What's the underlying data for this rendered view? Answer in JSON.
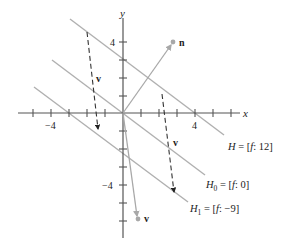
{
  "axes": {
    "x_label": "x",
    "y_label": "y",
    "x_tick_labels": [
      {
        "value": -4,
        "text": "−4"
      },
      {
        "value": 4,
        "text": "4"
      }
    ],
    "y_tick_labels": [
      {
        "value": 4,
        "text": "4"
      },
      {
        "value": -4,
        "text": "−4"
      }
    ],
    "x_range": [
      -6,
      6.5
    ],
    "y_range": [
      -7,
      5.4
    ],
    "tick_step": 1
  },
  "vectors": {
    "n": {
      "label": "n",
      "components": [
        3,
        4
      ]
    },
    "v": {
      "label": "v",
      "components": [
        0.8,
        -5.9
      ]
    }
  },
  "hyperplanes": [
    {
      "name": "H",
      "text_left": "H",
      "text_sub": "",
      "text_right": " = [",
      "f": "f",
      "value": ": 12]",
      "equation": "3x + 4y = 12"
    },
    {
      "name": "H0",
      "text_left": "H",
      "text_sub": "0",
      "text_right": " = [",
      "f": "f",
      "value": ": 0]",
      "equation": "3x + 4y = 0"
    },
    {
      "name": "H1",
      "text_left": "H",
      "text_sub": "1",
      "text_right": " = [",
      "f": "f",
      "value": ": −9]",
      "equation": "3x + 4y = -9"
    }
  ],
  "translated_v_labels": [
    "v",
    "v"
  ],
  "colors": {
    "axis": "#555555",
    "line": "#b0b0b0",
    "vector": "#a8a8a8",
    "dashed": "#333333",
    "text": "#222222"
  }
}
